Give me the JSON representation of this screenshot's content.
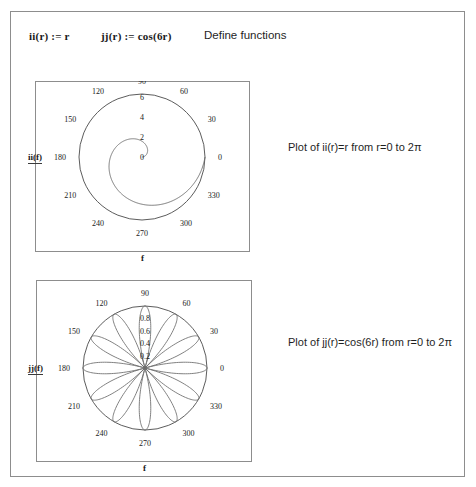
{
  "document": {
    "definitions": [
      {
        "name": "ii-definition",
        "text": "ii(r) := r"
      },
      {
        "name": "jj-definition",
        "text": "jj(r) := cos(6r)"
      }
    ],
    "define_functions_label": "Define functions"
  },
  "plots": [
    {
      "id": "plot-1",
      "yaxis_label": "ii(f)",
      "xaxis_label": "f",
      "caption": "Plot of ii(r)=r from r=0 to 2π",
      "chart_data": {
        "type": "line",
        "plot_kind": "polar",
        "title": "Plot of ii(r)=r from r=0 to 2π",
        "expression": "ii(r) = r",
        "angle_unit": "degrees",
        "angle_ticks": [
          0,
          30,
          60,
          90,
          120,
          150,
          180,
          210,
          240,
          270,
          300,
          330
        ],
        "radial_ticks": [
          0,
          2,
          4,
          6
        ],
        "rlim": [
          0,
          6.2831853
        ],
        "theta_range_deg": [
          0,
          360
        ],
        "grid": false,
        "boundary_circle": true,
        "series": [
          {
            "name": "ii(r)=r",
            "color": "#555555",
            "points_r": [
              0,
              0.5236,
              1.0472,
              1.5708,
              2.0944,
              2.618,
              3.1416,
              3.6652,
              4.1888,
              4.7124,
              5.236,
              5.7596,
              6.2832
            ],
            "points_theta_deg": [
              0,
              30,
              60,
              90,
              120,
              150,
              180,
              210,
              240,
              270,
              300,
              330,
              360
            ]
          }
        ]
      }
    },
    {
      "id": "plot-2",
      "yaxis_label": "jj(f)",
      "xaxis_label": "f",
      "caption": "Plot of jj(r)=cos(6r) from r=0 to 2π",
      "chart_data": {
        "type": "line",
        "plot_kind": "polar",
        "title": "Plot of jj(r)=cos(6r) from r=0 to 2π",
        "expression": "jj(r) = cos(6r)",
        "angle_unit": "degrees",
        "angle_ticks": [
          0,
          30,
          60,
          90,
          120,
          150,
          180,
          210,
          240,
          270,
          300,
          330
        ],
        "radial_ticks": [
          0.2,
          0.4,
          0.6,
          0.8
        ],
        "rlim": [
          0,
          1
        ],
        "theta_range_deg": [
          0,
          360
        ],
        "grid": false,
        "boundary_circle": true,
        "petal_count": 12,
        "series": [
          {
            "name": "jj(r)=cos(6r)",
            "color": "#555555",
            "description": "rose curve r = |cos(6θ)| with 12 petals"
          }
        ]
      }
    }
  ]
}
